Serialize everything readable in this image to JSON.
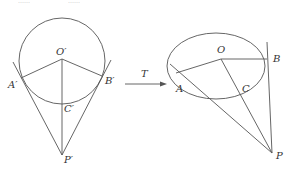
{
  "figure": {
    "left": {
      "labels": {
        "O": "O′",
        "A": "A′",
        "B": "B′",
        "C": "C′",
        "P": "P′"
      },
      "description": "Circle with center O′, tangent lines from P′ touching at A′ and B′, line O′P′ through C′"
    },
    "transform": {
      "label": "T"
    },
    "right": {
      "labels": {
        "O": "O",
        "A": "A",
        "B": "B",
        "C": "C",
        "P": "P"
      },
      "description": "Ellipse (affine image of circle) with center O, tangent lines from P touching at A and B, line OP through C"
    },
    "cropped_top_text": [
      "……",
      "……"
    ]
  }
}
